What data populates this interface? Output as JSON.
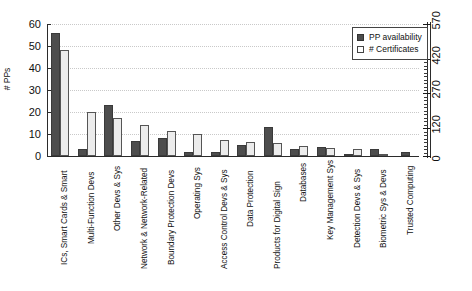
{
  "chart_data": {
    "type": "bar",
    "title": "",
    "xlabel": "",
    "ylabel": "# PPs",
    "y2label": "",
    "ylim": [
      0,
      60
    ],
    "y2lim": [
      0,
      570
    ],
    "yticks": [
      0,
      10,
      20,
      30,
      40,
      50,
      60
    ],
    "y2ticks": [
      0,
      120,
      270,
      420,
      570
    ],
    "grid": true,
    "legend_position": "top-right",
    "categories": [
      "ICs, Smart Cards & Smart",
      "Multi-Function Devs",
      "Other Devs & Sys",
      "Network & Network-Related",
      "Boundary Protection Devs",
      "Operating Sys",
      "Access Control Devs & Sys",
      "Data Protection",
      "Products for Digital Sign",
      "Databases",
      "Key Management Sys",
      "Detection Devs & Sys",
      "Biometric Sys & Devs",
      "Trusted Computing"
    ],
    "series": [
      {
        "name": "PP availability",
        "color": "#4d4d4d",
        "axis": "left",
        "values": [
          56,
          3,
          23,
          7,
          8,
          2,
          2,
          5,
          13,
          3,
          4,
          0.5,
          3,
          2
        ]
      },
      {
        "name": "# Certificates",
        "color": "#ececec",
        "axis": "right",
        "values": [
          48,
          20,
          17.5,
          14,
          11.5,
          10,
          7.5,
          6.5,
          6,
          4.5,
          3.5,
          3,
          0.5,
          0
        ]
      }
    ]
  },
  "legend": {
    "items": [
      {
        "label": "PP availability",
        "swatch": "dark-square-icon"
      },
      {
        "label": "# Certificates",
        "swatch": "light-square-icon"
      }
    ]
  },
  "axes": {
    "left": {
      "title": "# PPs",
      "ticks": [
        "0",
        "10",
        "20",
        "30",
        "40",
        "50",
        "60"
      ]
    },
    "right": {
      "ticks": [
        "0",
        "120",
        "270",
        "420",
        "570"
      ]
    }
  }
}
